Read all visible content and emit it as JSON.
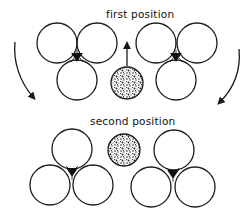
{
  "diagram": {
    "labels": {
      "first": "first position",
      "second": "second position"
    },
    "colors": {
      "stroke": "#1a1a1a",
      "background": "#ffffff",
      "speckle_dark": "#222222"
    },
    "first_position": {
      "left_cluster": [
        {
          "cx": 57,
          "cy": 43,
          "r": 20
        },
        {
          "cx": 97,
          "cy": 43,
          "r": 20
        },
        {
          "cx": 77,
          "cy": 80,
          "r": 20
        }
      ],
      "left_junction": {
        "cx": 77,
        "cy": 56
      },
      "right_cluster": [
        {
          "cx": 156,
          "cy": 43,
          "r": 20
        },
        {
          "cx": 197,
          "cy": 43,
          "r": 20
        },
        {
          "cx": 176,
          "cy": 80,
          "r": 20
        }
      ],
      "right_junction": {
        "cx": 176,
        "cy": 56
      },
      "speckled_particle": {
        "cx": 127,
        "cy": 83,
        "r": 16
      },
      "up_arrow": {
        "x": 127,
        "y1": 66,
        "y2": 42
      }
    },
    "second_position": {
      "left_cluster": [
        {
          "cx": 72,
          "cy": 149,
          "r": 20
        },
        {
          "cx": 50,
          "cy": 185,
          "r": 20
        },
        {
          "cx": 93,
          "cy": 185,
          "r": 20
        }
      ],
      "left_junction": {
        "cx": 72,
        "cy": 172
      },
      "right_cluster": [
        {
          "cx": 174,
          "cy": 150,
          "r": 20
        },
        {
          "cx": 151,
          "cy": 187,
          "r": 20
        },
        {
          "cx": 195,
          "cy": 187,
          "r": 20
        }
      ],
      "right_junction": {
        "cx": 173,
        "cy": 174
      },
      "speckled_particle": {
        "cx": 124,
        "cy": 150,
        "r": 16
      }
    },
    "curved_arrows": [
      {
        "name": "left-rotation-arrow",
        "direction": "down"
      },
      {
        "name": "right-rotation-arrow",
        "direction": "down"
      }
    ]
  }
}
